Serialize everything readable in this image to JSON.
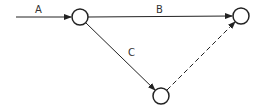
{
  "diagram": {
    "type": "activity-network",
    "nodes": [
      {
        "id": "n1",
        "cx": 80,
        "cy": 17,
        "r": 8
      },
      {
        "id": "n2",
        "cx": 241,
        "cy": 16,
        "r": 8
      },
      {
        "id": "n3",
        "cx": 161,
        "cy": 96,
        "r": 8
      }
    ],
    "edges": [
      {
        "label": "A",
        "from": "start",
        "to": "n1",
        "style": "solid"
      },
      {
        "label": "B",
        "from": "n1",
        "to": "n2",
        "style": "solid"
      },
      {
        "label": "C",
        "from": "n1",
        "to": "n3",
        "style": "solid"
      },
      {
        "label": "",
        "from": "n3",
        "to": "n2",
        "style": "dashed"
      }
    ],
    "labels": {
      "a": "A",
      "b": "B",
      "c": "C"
    },
    "colors": {
      "stroke": "#222222",
      "label": "#333333",
      "background": "#ffffff"
    }
  }
}
